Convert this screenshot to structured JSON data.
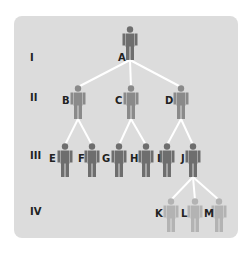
{
  "colors": {
    "background": "#dcdcdc",
    "lines": "#ffffff",
    "affected": "#6e6e6e",
    "carrier": "#8a8a8a",
    "unaffected": "#b3b3b3"
  },
  "generations": [
    {
      "label": "I",
      "y": 60
    },
    {
      "label": "II",
      "y": 100
    },
    {
      "label": "III",
      "y": 158
    },
    {
      "label": "IV",
      "y": 214
    }
  ],
  "people": [
    {
      "id": "A",
      "gen": "I",
      "x": 130,
      "y": 26,
      "tone": "affected",
      "label_x": 118,
      "label_y": 52
    },
    {
      "id": "B",
      "gen": "II",
      "x": 78,
      "y": 85,
      "tone": "carrier",
      "label_x": 62,
      "label_y": 95
    },
    {
      "id": "C",
      "gen": "II",
      "x": 131,
      "y": 85,
      "tone": "carrier",
      "label_x": 115,
      "label_y": 95
    },
    {
      "id": "D",
      "gen": "II",
      "x": 181,
      "y": 85,
      "tone": "carrier",
      "label_x": 165,
      "label_y": 95
    },
    {
      "id": "E",
      "gen": "III",
      "x": 65,
      "y": 143,
      "tone": "affected",
      "label_x": 49,
      "label_y": 153
    },
    {
      "id": "F",
      "gen": "III",
      "x": 92,
      "y": 143,
      "tone": "affected",
      "label_x": 78,
      "label_y": 153
    },
    {
      "id": "G",
      "gen": "III",
      "x": 119,
      "y": 143,
      "tone": "affected",
      "label_x": 102,
      "label_y": 153
    },
    {
      "id": "H",
      "gen": "III",
      "x": 146,
      "y": 143,
      "tone": "affected",
      "label_x": 130,
      "label_y": 153
    },
    {
      "id": "I",
      "gen": "III",
      "x": 167,
      "y": 143,
      "tone": "affected",
      "label_x": 157,
      "label_y": 153
    },
    {
      "id": "J",
      "gen": "III",
      "x": 193,
      "y": 143,
      "tone": "affected",
      "label_x": 181,
      "label_y": 153
    },
    {
      "id": "K",
      "gen": "IV",
      "x": 171,
      "y": 198,
      "tone": "unaffected",
      "label_x": 155,
      "label_y": 208
    },
    {
      "id": "L",
      "gen": "IV",
      "x": 195,
      "y": 198,
      "tone": "unaffected",
      "label_x": 181,
      "label_y": 208
    },
    {
      "id": "M",
      "gen": "IV",
      "x": 219,
      "y": 198,
      "tone": "unaffected",
      "label_x": 204,
      "label_y": 208
    }
  ],
  "links": [
    [
      "A",
      "B"
    ],
    [
      "A",
      "C"
    ],
    [
      "A",
      "D"
    ],
    [
      "B",
      "E"
    ],
    [
      "B",
      "F"
    ],
    [
      "C",
      "G"
    ],
    [
      "C",
      "H"
    ],
    [
      "D",
      "I"
    ],
    [
      "D",
      "J"
    ],
    [
      "J",
      "K"
    ],
    [
      "J",
      "L"
    ],
    [
      "J",
      "M"
    ]
  ]
}
